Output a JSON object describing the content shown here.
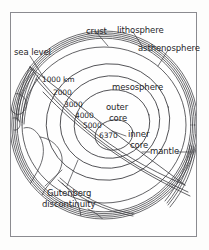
{
  "diagram": {
    "type": "cutaway-sphere-cross-section",
    "background_color": "#fefefe",
    "frame_color": "#8b8b90",
    "line_color": "#3a3a3e",
    "text_color": "#26262a",
    "layer_labels": [
      {
        "id": "crust",
        "text": "crust",
        "x": 86,
        "y": 27
      },
      {
        "id": "lithosphere",
        "text": "lithosphere",
        "x": 118,
        "y": 27
      },
      {
        "id": "asthenosphere",
        "text": "asthenosphere",
        "x": 140,
        "y": 45
      },
      {
        "id": "sea-level",
        "text": "sea level",
        "x": 14,
        "y": 50
      },
      {
        "id": "mesosphere",
        "text": "mesosphere",
        "x": 113,
        "y": 84
      },
      {
        "id": "outer-core-l1",
        "text": "outer",
        "x": 106,
        "y": 104
      },
      {
        "id": "outer-core-l2",
        "text": "core",
        "x": 108,
        "y": 116
      },
      {
        "id": "inner-core-l1",
        "text": "inner",
        "x": 128,
        "y": 131
      },
      {
        "id": "inner-core-l2",
        "text": "core",
        "x": 130,
        "y": 143
      },
      {
        "id": "mantle",
        "text": "mantle",
        "x": 152,
        "y": 149
      },
      {
        "id": "gutenberg-l1",
        "text": "Gutenberg",
        "x": 49,
        "y": 193
      },
      {
        "id": "gutenberg-l2",
        "text": "discontinuity",
        "x": 44,
        "y": 205
      }
    ],
    "depth_labels": [
      {
        "id": "depth-1000",
        "text": "1000 km",
        "x": 42,
        "y": 80
      },
      {
        "id": "depth-2000",
        "text": "2000",
        "x": 53,
        "y": 93
      },
      {
        "id": "depth-3000",
        "text": "3000",
        "x": 64,
        "y": 106
      },
      {
        "id": "depth-4000",
        "text": "4000",
        "x": 75,
        "y": 117
      },
      {
        "id": "depth-5000",
        "text": "5000",
        "x": 83,
        "y": 127
      },
      {
        "id": "depth-6370",
        "text": "6370",
        "x": 99,
        "y": 137
      }
    ]
  }
}
